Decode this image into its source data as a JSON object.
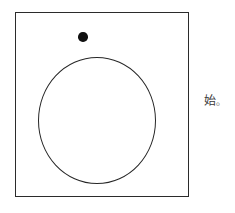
{
  "figure": {
    "background_color": "#ffffff",
    "stroke_color": "#2b2b2b",
    "fill_color": "#111111",
    "shapes": {
      "frame": {
        "name": "square-frame",
        "type": "rectangle",
        "x": 15,
        "y": 12,
        "width": 174,
        "height": 185,
        "stroke": "#2b2b2b",
        "stroke_width": 1.4,
        "fill": "none"
      },
      "circle": {
        "name": "large-circle",
        "type": "circle",
        "center_x": 97,
        "center_y": 120,
        "radius_x": 59,
        "radius_y": 63,
        "stroke": "#262626",
        "stroke_width": 1.3,
        "fill": "none"
      },
      "dot": {
        "name": "filled-dot",
        "type": "circle",
        "center_x": 83,
        "center_y": 37,
        "radius": 4.75,
        "stroke": "none",
        "fill": "#111111"
      }
    }
  },
  "caption": {
    "character": "始",
    "punctuation": "。",
    "full_text": "始。",
    "color": "#3a3a3a",
    "font_size_px": 12
  }
}
